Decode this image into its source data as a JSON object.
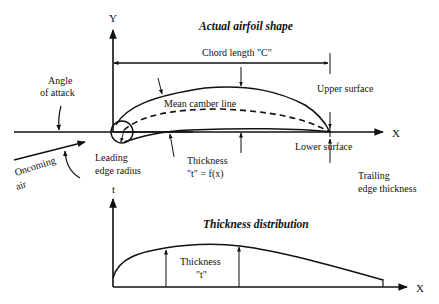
{
  "diagram": {
    "top": {
      "title": "Actual airfoil shape",
      "y_axis_label": "Y",
      "x_axis_label": "X",
      "chord_label": "Chord length \"C\"",
      "angle_of_attack_line1": "Angle",
      "angle_of_attack_line2": "of attack",
      "mean_camber_line": "Mean camber line",
      "upper_surface": "Upper surface",
      "lower_surface": "Lower surface",
      "oncoming_air_line1": "Oncoming",
      "oncoming_air_line2": "air",
      "leading_edge_line1": "Leading",
      "leading_edge_line2": "edge radius",
      "thickness_line1": "Thickness",
      "thickness_line2": "\"t\" = f(x)",
      "trailing_edge_line1": "Trailing",
      "trailing_edge_line2": "edge thickness"
    },
    "bottom": {
      "title": "Thickness distribution",
      "y_axis_label": "t",
      "x_axis_label": "X",
      "thickness_line1": "Thickness",
      "thickness_line2": "\"t\""
    }
  }
}
